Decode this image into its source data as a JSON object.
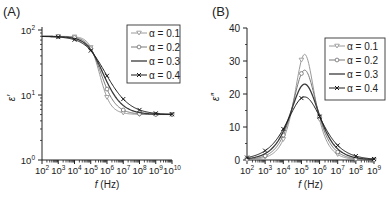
{
  "figure": {
    "panels": [
      {
        "label": "(A)",
        "ylabel": "ε′",
        "xlabel_italic": "f",
        "xlabel_unit": "(Hz)"
      },
      {
        "label": "(B)",
        "ylabel": "ε″",
        "xlabel_italic": "f",
        "xlabel_unit": "(Hz)"
      }
    ],
    "legend": [
      {
        "symbol": "triangle-down",
        "label": "α = 0.1",
        "color": "#9a9a9a"
      },
      {
        "symbol": "circle",
        "label": "α = 0.2",
        "color": "#7a7a7a"
      },
      {
        "symbol": "none",
        "label": "α = 0.3",
        "color": "#3a3a3a"
      },
      {
        "symbol": "x-cross",
        "label": "α = 0.4",
        "color": "#1a1a1a"
      }
    ]
  },
  "chart_data": [
    {
      "type": "line",
      "title": "(A)",
      "xlabel": "f (Hz)",
      "ylabel": "ε′",
      "xscale": "log",
      "yscale": "log",
      "xlim": [
        100,
        10000000000
      ],
      "ylim": [
        1,
        100
      ],
      "x_ticks": [
        "10^2",
        "10^3",
        "10^4",
        "10^5",
        "10^6",
        "10^7",
        "10^8",
        "10^9",
        "10^10"
      ],
      "y_ticks": [
        "10^0",
        "10^1",
        "10^2"
      ],
      "legend_position": "upper right",
      "grid": false,
      "model": {
        "name": "Cole-Cole",
        "eps_inf": 5,
        "eps_s": 80,
        "f_peak_hz": 150000
      },
      "x": [
        100,
        1000,
        10000,
        100000,
        1000000,
        10000000,
        100000000,
        1000000000,
        10000000000
      ],
      "series": [
        {
          "name": "α = 0.1",
          "alpha": 0.1,
          "values": [
            80.0,
            79.86,
            78.45,
            53.9,
            9.22,
            5.3,
            5.03,
            5.0,
            5.0
          ]
        },
        {
          "name": "α = 0.2",
          "alpha": 0.2,
          "values": [
            79.93,
            79.56,
            76.64,
            51.6,
            12.34,
            5.88,
            5.13,
            5.02,
            5.0
          ]
        },
        {
          "name": "α = 0.3",
          "alpha": 0.3,
          "values": [
            79.84,
            78.94,
            74.13,
            49.7,
            15.9,
            6.91,
            5.36,
            5.07,
            5.01
          ]
        },
        {
          "name": "α = 0.4",
          "alpha": 0.4,
          "values": [
            79.45,
            77.77,
            70.88,
            48.2,
            19.75,
            8.66,
            5.9,
            5.22,
            5.06
          ]
        }
      ]
    },
    {
      "type": "line",
      "title": "(B)",
      "xlabel": "f (Hz)",
      "ylabel": "ε″",
      "xscale": "log",
      "yscale": "linear",
      "xlim": [
        100,
        1000000000
      ],
      "ylim": [
        0,
        40
      ],
      "x_ticks": [
        "10^2",
        "10^3",
        "10^4",
        "10^5",
        "10^6",
        "10^7",
        "10^8",
        "10^9"
      ],
      "y_ticks": [
        0,
        10,
        20,
        30,
        40
      ],
      "legend_position": "upper right",
      "grid": false,
      "model": {
        "name": "Cole-Cole",
        "eps_inf": 5,
        "eps_s": 80,
        "f_peak_hz": 150000
      },
      "x": [
        100,
        1000,
        10000,
        100000,
        150000,
        1000000,
        10000000,
        100000000,
        1000000000
      ],
      "series": [
        {
          "name": "α = 0.1",
          "alpha": 0.1,
          "values": [
            0.1,
            0.81,
            6.25,
            30.3,
            32.0,
            12.33,
            1.68,
            0.21,
            0.03
          ],
          "peak": 32.0
        },
        {
          "name": "α = 0.2",
          "alpha": 0.2,
          "values": [
            0.21,
            1.28,
            7.54,
            26.2,
            27.2,
            13.21,
            2.42,
            0.39,
            0.06
          ],
          "peak": 27.2
        },
        {
          "name": "α = 0.3",
          "alpha": 0.3,
          "values": [
            0.4,
            1.95,
            8.66,
            22.36,
            23.0,
            13.51,
            3.36,
            0.7,
            0.14
          ],
          "peak": 23.0
        },
        {
          "name": "α = 0.4",
          "alpha": 0.4,
          "values": [
            0.74,
            2.83,
            9.41,
            18.76,
            19.1,
            13.14,
            4.43,
            1.2,
            0.31
          ],
          "peak": 19.1
        }
      ]
    }
  ]
}
